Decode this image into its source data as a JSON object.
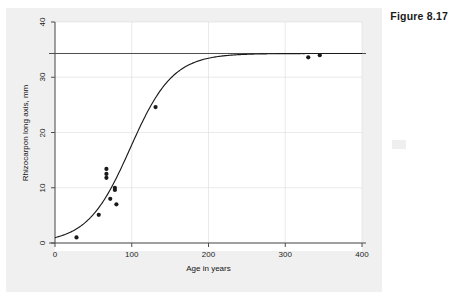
{
  "figure": {
    "caption": "Figure 8.17"
  },
  "chart_data": {
    "type": "scatter",
    "title": "",
    "subtitle": "",
    "xlabel": "Age in years",
    "ylabel": "Rhizocarpon long axis, mm",
    "xlim": [
      0,
      400
    ],
    "ylim": [
      0,
      40
    ],
    "xticks": [
      0,
      100,
      200,
      300,
      400
    ],
    "xtick_labels": [
      "0",
      "100",
      "200",
      "300",
      "400"
    ],
    "yticks": [
      0,
      10,
      20,
      30,
      40
    ],
    "ytick_labels": [
      "0",
      "10",
      "20",
      "30",
      "40"
    ],
    "grid": true,
    "grid_color": "#dcdcdc",
    "legend": null,
    "background_color": "#f0f0f0",
    "plot_background_color": "#ffffff",
    "series": [
      {
        "name": "Observed lichen measurements",
        "type": "scatter",
        "marker": "filled-circle",
        "color": "#1a1a1a",
        "points": [
          {
            "x": 28,
            "y": 1.0
          },
          {
            "x": 57,
            "y": 5.1
          },
          {
            "x": 67,
            "y": 13.4
          },
          {
            "x": 67,
            "y": 12.5
          },
          {
            "x": 67,
            "y": 11.8
          },
          {
            "x": 72,
            "y": 8.0
          },
          {
            "x": 78,
            "y": 10.0
          },
          {
            "x": 78,
            "y": 9.6
          },
          {
            "x": 80,
            "y": 7.0
          },
          {
            "x": 131,
            "y": 24.6
          },
          {
            "x": 330,
            "y": 33.6
          },
          {
            "x": 345,
            "y": 34.0
          }
        ]
      },
      {
        "name": "Fitted logistic growth curve",
        "type": "line",
        "color": "#1a1a1a",
        "model": "logistic",
        "asymptote": 34.3,
        "midpoint_x": 98,
        "rate": 0.036
      }
    ],
    "reference_lines": [
      {
        "orientation": "horizontal",
        "value": 34.3,
        "color": "#4d4d4d",
        "label": ""
      },
      {
        "orientation": "horizontal",
        "value": 0.0,
        "color": "#4d4d4d",
        "label": ""
      }
    ]
  }
}
